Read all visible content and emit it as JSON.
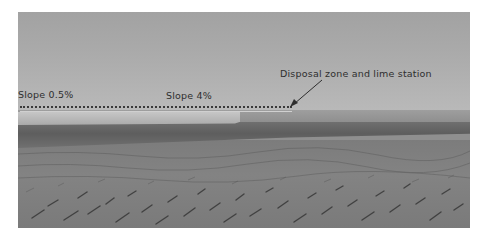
{
  "figure": {
    "colors": {
      "sky": "#aaaaaa",
      "horizon_band": "#5e5e5e",
      "ground": "#808080",
      "annotation_text": "#2e2e2e",
      "background": "#ffffff"
    }
  },
  "annotations": {
    "slope_left": "Slope 0.5%",
    "slope_middle": "Slope 4%",
    "disposal": "Disposal zone and lime station"
  }
}
